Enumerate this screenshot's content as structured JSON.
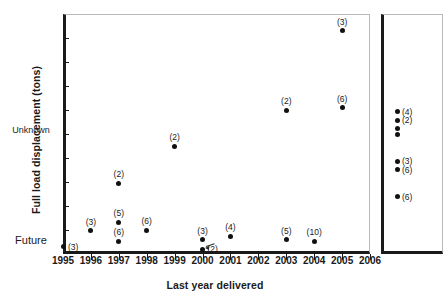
{
  "chart_data": {
    "type": "scatter",
    "title": "",
    "xlabel": "Last year delivered",
    "ylabel": "Full load displacement (tons)",
    "ylim": [
      0,
      5000
    ],
    "ytick_labels": [
      "0",
      "500",
      "1,000",
      "1,500",
      "2,000",
      "2,500",
      "3,000",
      "3,500",
      "4,000",
      "4,500",
      "5,000"
    ],
    "ytick_values": [
      0,
      500,
      1000,
      1500,
      2000,
      2500,
      3000,
      3500,
      4000,
      4500,
      5000
    ],
    "xtick_labels": [
      "1995",
      "1996",
      "1997",
      "1998",
      "1999",
      "2000",
      "2001",
      "2002",
      "2003",
      "2004",
      "2005",
      "2006"
    ],
    "xtick_values": [
      1995,
      1996,
      1997,
      1998,
      1999,
      2000,
      2001,
      2002,
      2003,
      2004,
      2005,
      2006
    ],
    "xlim": [
      1995,
      2006
    ],
    "grid": false,
    "legend": false,
    "point_label_meaning": "count in parentheses",
    "points": [
      {
        "x": 1995,
        "y": 150,
        "label": "(3)",
        "label_pos": "right"
      },
      {
        "x": 1996,
        "y": 480,
        "label": "(3)",
        "label_pos": "above"
      },
      {
        "x": 1997,
        "y": 1470,
        "label": "(2)",
        "label_pos": "above"
      },
      {
        "x": 1997,
        "y": 660,
        "label": "(5)",
        "label_pos": "above"
      },
      {
        "x": 1997,
        "y": 270,
        "label": "(6)",
        "label_pos": "above"
      },
      {
        "x": 1998,
        "y": 500,
        "label": "(6)",
        "label_pos": "above"
      },
      {
        "x": 1999,
        "y": 2250,
        "label": "(2)",
        "label_pos": "above"
      },
      {
        "x": 2000,
        "y": 300,
        "label": "(3)",
        "label_pos": "above"
      },
      {
        "x": 2000,
        "y": 100,
        "label": "(2)",
        "label_pos": "right"
      },
      {
        "x": 2001,
        "y": 370,
        "label": "(4)",
        "label_pos": "above"
      },
      {
        "x": 2003,
        "y": 3000,
        "label": "(2)",
        "label_pos": "above"
      },
      {
        "x": 2003,
        "y": 300,
        "label": "(5)",
        "label_pos": "above"
      },
      {
        "x": 2004,
        "y": 270,
        "label": "(10)",
        "label_pos": "above"
      },
      {
        "x": 2005,
        "y": 4650,
        "label": "(3)",
        "label_pos": "above"
      },
      {
        "x": 2005,
        "y": 3050,
        "label": "(6)",
        "label_pos": "above"
      }
    ],
    "future_panel": {
      "footer_label": "Future",
      "group_caption": "Unknown",
      "points": [
        {
          "y": 2960,
          "label": "(4)"
        },
        {
          "y": 2790,
          "label": "(2)"
        },
        {
          "y": 2620,
          "label": ""
        },
        {
          "y": 2480,
          "label": ""
        },
        {
          "y": 1930,
          "label": "(3)"
        },
        {
          "y": 1760,
          "label": "(6)"
        },
        {
          "y": 1190,
          "label": "(6)"
        }
      ]
    }
  }
}
